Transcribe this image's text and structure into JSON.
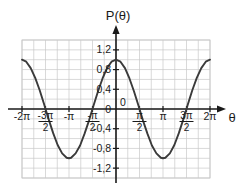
{
  "chart_data": {
    "type": "line",
    "title": "",
    "xlabel": "θ",
    "ylabel": "P(θ)",
    "function": "P(θ) = cos(θ)",
    "xlim": [
      -6.2831853,
      6.2831853
    ],
    "ylim": [
      -1.4,
      1.4
    ],
    "grid": true,
    "legend": false,
    "x_tick_labels": [
      "-2π",
      "-3π/2",
      "-π",
      "-π/2",
      "0",
      "π/2",
      "π",
      "3π/2",
      "2π"
    ],
    "x_tick_values": [
      -6.2831853,
      -4.712389,
      -3.1415927,
      -1.5707963,
      0,
      1.5707963,
      3.1415927,
      4.712389,
      6.2831853
    ],
    "y_tick_labels": [
      "1,2",
      "0,8",
      "0,4",
      "0",
      "-0,4",
      "-0,8",
      "-1,2"
    ],
    "y_tick_values": [
      1.2,
      0.8,
      0.4,
      0,
      -0.4,
      -0.8,
      -1.2
    ],
    "x": [
      -6.2831853,
      -6.0,
      -5.7,
      -5.4,
      -5.1,
      -4.8,
      -4.712389,
      -4.5,
      -4.2,
      -3.9,
      -3.6,
      -3.3,
      -3.1415927,
      -3.0,
      -2.7,
      -2.4,
      -2.1,
      -1.8,
      -1.5707963,
      -1.5,
      -1.2,
      -0.9,
      -0.6,
      -0.3,
      0,
      0.3,
      0.6,
      0.9,
      1.2,
      1.5,
      1.5707963,
      1.8,
      2.1,
      2.4,
      2.7,
      3.0,
      3.1415927,
      3.3,
      3.6,
      3.9,
      4.2,
      4.5,
      4.712389,
      4.8,
      5.1,
      5.4,
      5.7,
      6.0,
      6.2831853
    ],
    "y": [
      1.0,
      0.96,
      0.83,
      0.63,
      0.38,
      0.09,
      0.0,
      -0.21,
      -0.49,
      -0.73,
      -0.9,
      -0.99,
      -1.0,
      -0.99,
      -0.9,
      -0.74,
      -0.5,
      -0.23,
      0.0,
      0.07,
      0.36,
      0.62,
      0.83,
      0.96,
      1.0,
      0.96,
      0.83,
      0.62,
      0.36,
      0.07,
      0.0,
      -0.23,
      -0.5,
      -0.74,
      -0.9,
      -0.99,
      -1.0,
      -0.99,
      -0.9,
      -0.73,
      -0.49,
      -0.21,
      0.0,
      0.09,
      0.38,
      0.63,
      0.83,
      0.96,
      1.0
    ],
    "colors": {
      "curve": "#3a3a3a",
      "axis": "#1a1a1a",
      "grid": "#c9c9c9",
      "background": "#ffffff"
    }
  },
  "x_ticks": [
    {
      "label": "-2π",
      "kind": "plain",
      "num": "",
      "den": "",
      "value": -6.2831853
    },
    {
      "label": "-3π/2",
      "kind": "fraction",
      "num": "-3π",
      "den": "2",
      "value": -4.712389
    },
    {
      "label": "-π",
      "kind": "plain",
      "num": "",
      "den": "",
      "value": -3.1415927
    },
    {
      "label": "-π/2",
      "kind": "fraction",
      "num": "-π",
      "den": "2",
      "value": -1.5707963
    },
    {
      "label": "0",
      "kind": "plain",
      "num": "",
      "den": "",
      "value": 0
    },
    {
      "label": "π/2",
      "kind": "fraction",
      "num": "π",
      "den": "2",
      "value": 1.5707963
    },
    {
      "label": "π",
      "kind": "plain",
      "num": "",
      "den": "",
      "value": 3.1415927
    },
    {
      "label": "3π/2",
      "kind": "fraction",
      "num": "3π",
      "den": "2",
      "value": 4.712389
    },
    {
      "label": "2π",
      "kind": "plain",
      "num": "",
      "den": "",
      "value": 6.2831853
    }
  ],
  "y_ticks": [
    {
      "label": "1,2",
      "value": 1.2
    },
    {
      "label": "0,8",
      "value": 0.8
    },
    {
      "label": "0,4",
      "value": 0.4
    },
    {
      "label": "0",
      "value": 0
    },
    {
      "label": "-0,4",
      "value": -0.4
    },
    {
      "label": "-0,8",
      "value": -0.8
    },
    {
      "label": "-1,2",
      "value": -1.2
    }
  ],
  "labels": {
    "y_axis_title": "P(θ)",
    "x_axis_title": "θ"
  }
}
